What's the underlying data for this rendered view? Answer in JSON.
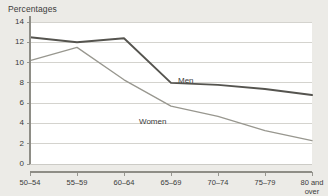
{
  "chart_data": {
    "type": "line",
    "title": "Percentages",
    "xlabel": "",
    "ylabel": "",
    "categories": [
      "50–54",
      "55–59",
      "60–64",
      "65–69",
      "70–74",
      "75–79",
      "80 and\nover"
    ],
    "ylim": [
      0,
      14
    ],
    "yticks": [
      0,
      2,
      4,
      6,
      8,
      10,
      12,
      14
    ],
    "ytick_labels": [
      "0",
      "2",
      "4",
      "6",
      "8",
      "10",
      "12",
      "14"
    ],
    "grid": "horizontal",
    "legend_position": "inline-annotations",
    "series": [
      {
        "name": "Men",
        "values": [
          12.5,
          12.0,
          12.4,
          8.0,
          7.8,
          7.4,
          6.8
        ],
        "color": "#55544f",
        "width": 1.9,
        "label_x": 178,
        "label_y": 76
      },
      {
        "name": "Women",
        "values": [
          10.2,
          11.5,
          8.3,
          5.7,
          4.7,
          3.3,
          2.3
        ],
        "color": "#98978f",
        "width": 1.3,
        "label_x": 139,
        "label_y": 117
      }
    ],
    "colors": {
      "background": "#ecebe7",
      "plot_background": "#ffffff",
      "grid": "#c9c8c2",
      "axis": "#8e8d86",
      "text": "#3b3b3b",
      "men": "#55544f",
      "women": "#98978f"
    }
  }
}
